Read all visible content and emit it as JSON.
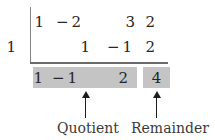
{
  "figure": {
    "type": "synthetic-division",
    "divisor": "1",
    "top_row": [
      "1",
      "− 2",
      "3",
      "2"
    ],
    "middle_row": [
      "1",
      "− 1",
      "2"
    ],
    "bottom_row": [
      "1",
      "− 1",
      "2"
    ],
    "remainder": "4",
    "labels": {
      "quotient_label": "Quotient",
      "remainder_label": "Remainder"
    },
    "colors": {
      "highlight": "#c4c4c4",
      "line": "#6a6a6a",
      "bracket_line": "#858585",
      "text": "#262626",
      "arrow": "#1c1c1c"
    }
  }
}
